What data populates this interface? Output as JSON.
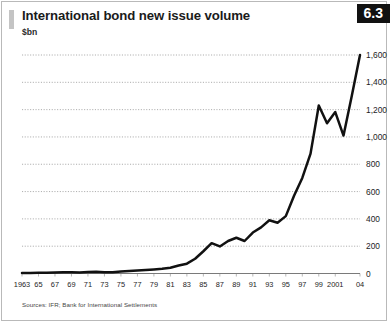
{
  "figure": {
    "number": "6.3",
    "title": "International bond new issue volume",
    "unit": "$bn",
    "source": "Sources: IFR; Bank for International Settlements",
    "accent_color": "#c4c4c4",
    "badge_color": "#111111",
    "line_color": "#111111"
  },
  "chart_data": {
    "type": "line",
    "title": "International bond new issue volume",
    "xlabel": "",
    "ylabel": "$bn",
    "ylim": [
      0,
      1600
    ],
    "xlim": [
      1963,
      2004
    ],
    "grid": true,
    "legend": false,
    "ytick_labels": [
      "0",
      "200",
      "400",
      "600",
      "800",
      "1,000",
      "1,200",
      "1,400",
      "1,600"
    ],
    "ytick_values": [
      0,
      200,
      400,
      600,
      800,
      1000,
      1200,
      1400,
      1600
    ],
    "xtick_labels": [
      "1963",
      "65",
      "67",
      "69",
      "71",
      "73",
      "75",
      "77",
      "79",
      "81",
      "83",
      "85",
      "87",
      "89",
      "91",
      "93",
      "95",
      "97",
      "99",
      "2001",
      "04"
    ],
    "xtick_values": [
      1963,
      1965,
      1967,
      1969,
      1971,
      1973,
      1975,
      1977,
      1979,
      1981,
      1983,
      1985,
      1987,
      1989,
      1991,
      1993,
      1995,
      1997,
      1999,
      2001,
      2004
    ],
    "x": [
      1963,
      1964,
      1965,
      1966,
      1967,
      1968,
      1969,
      1970,
      1971,
      1972,
      1973,
      1974,
      1975,
      1976,
      1977,
      1978,
      1979,
      1980,
      1981,
      1982,
      1983,
      1984,
      1985,
      1986,
      1987,
      1988,
      1989,
      1990,
      1991,
      1992,
      1993,
      1994,
      1995,
      1996,
      1997,
      1998,
      1999,
      2000,
      2001,
      2002,
      2003,
      2004
    ],
    "values": [
      3,
      4,
      5,
      6,
      8,
      10,
      9,
      8,
      11,
      12,
      10,
      9,
      14,
      18,
      22,
      26,
      30,
      34,
      42,
      58,
      72,
      108,
      163,
      222,
      198,
      238,
      262,
      238,
      300,
      338,
      390,
      372,
      420,
      570,
      700,
      878,
      1230,
      1100,
      1182,
      1010,
      1300,
      1600
    ],
    "series": [
      {
        "name": "International bond new issue volume",
        "values": [
          3,
          4,
          5,
          6,
          8,
          10,
          9,
          8,
          11,
          12,
          10,
          9,
          14,
          18,
          22,
          26,
          30,
          34,
          42,
          58,
          72,
          108,
          163,
          222,
          198,
          238,
          262,
          238,
          300,
          338,
          390,
          372,
          420,
          570,
          700,
          878,
          1230,
          1100,
          1182,
          1010,
          1300,
          1600
        ]
      }
    ]
  }
}
